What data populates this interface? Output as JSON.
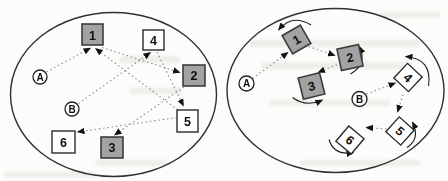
{
  "diagram": {
    "colors": {
      "shaded_box": "#a2a2a2",
      "box_border": "#3d3d3d",
      "white_box": "#ffffff",
      "ellipse_outline": "#303030",
      "dotted_line": "#8f8f8f",
      "arrowhead": "#141414",
      "background": "#fcfcfa"
    },
    "left": {
      "nodes": {
        "a": "A",
        "b": "B",
        "box1": "1",
        "box2": "2",
        "box3": "3",
        "box4": "4",
        "box5": "5",
        "box6": "6"
      },
      "shaded_boxes": [
        "1",
        "2",
        "3"
      ],
      "edges": [
        {
          "from": "A",
          "to": "1"
        },
        {
          "from": "5",
          "to": "1"
        },
        {
          "from": "1",
          "to": "2"
        },
        {
          "from": "2",
          "to": "3"
        },
        {
          "from": "B",
          "to": "4"
        },
        {
          "from": "4",
          "to": "5"
        },
        {
          "from": "5",
          "to": "6"
        }
      ]
    },
    "right": {
      "nodes": {
        "a": "A",
        "b": "B",
        "box1": "1",
        "box2": "2",
        "box3": "3",
        "box4": "4",
        "box5": "5",
        "box6": "6"
      },
      "shaded_boxes": [
        "1",
        "2",
        "3"
      ],
      "rotation_indicators": [
        "1",
        "2",
        "3",
        "4",
        "5",
        "6"
      ],
      "edges": [
        {
          "from": "A",
          "to": "1"
        },
        {
          "from": "1",
          "to": "2"
        },
        {
          "from": "2",
          "to": "3"
        },
        {
          "from": "B",
          "to": "4"
        },
        {
          "from": "4",
          "to": "5"
        },
        {
          "from": "5",
          "to": "6"
        }
      ]
    }
  }
}
